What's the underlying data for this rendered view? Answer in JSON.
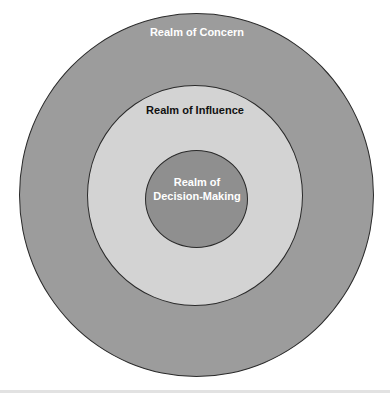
{
  "diagram": {
    "type": "concentric-circles",
    "top_caption_cut": "",
    "circles": [
      {
        "id": "outer",
        "label": "Realm of Concern",
        "fill": "#9c9c9c",
        "text_color": "#ffffff"
      },
      {
        "id": "middle",
        "label": "Realm of Influence",
        "fill": "#d3d3d3",
        "text_color": "#111111"
      },
      {
        "id": "inner",
        "label_line1": "Realm of",
        "label_line2": "Decision-Making",
        "fill": "#8f8f8f",
        "text_color": "#ffffff"
      }
    ]
  }
}
